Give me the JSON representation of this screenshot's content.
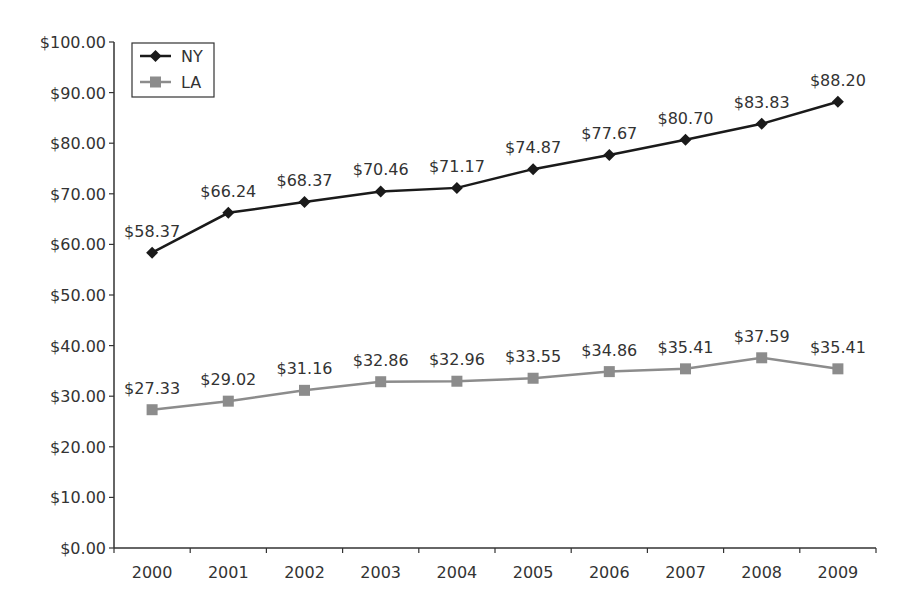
{
  "chart_data": {
    "type": "line",
    "title": "",
    "xlabel": "",
    "ylabel": "",
    "categories": [
      "2000",
      "2001",
      "2002",
      "2003",
      "2004",
      "2005",
      "2006",
      "2007",
      "2008",
      "2009"
    ],
    "series": [
      {
        "name": "NY",
        "color": "#1a1a1a",
        "marker": "diamond",
        "values": [
          58.37,
          66.24,
          68.37,
          70.46,
          71.17,
          74.87,
          77.67,
          80.7,
          83.83,
          88.2
        ],
        "labels": [
          "$58.37",
          "$66.24",
          "$68.37",
          "$70.46",
          "$71.17",
          "$74.87",
          "$77.67",
          "$80.70",
          "$83.83",
          "$88.20"
        ]
      },
      {
        "name": "LA",
        "color": "#8c8c8c",
        "marker": "square",
        "values": [
          27.33,
          29.02,
          31.16,
          32.86,
          32.96,
          33.55,
          34.86,
          35.41,
          37.59,
          35.41
        ],
        "labels": [
          "$27.33",
          "$29.02",
          "$31.16",
          "$32.86",
          "$32.96",
          "$33.55",
          "$34.86",
          "$35.41",
          "$37.59",
          "$35.41"
        ]
      }
    ],
    "ylim": [
      0,
      100
    ],
    "yticks": [
      0,
      10,
      20,
      30,
      40,
      50,
      60,
      70,
      80,
      90,
      100
    ],
    "ytick_labels": [
      "$0.00",
      "$10.00",
      "$20.00",
      "$30.00",
      "$40.00",
      "$50.00",
      "$60.00",
      "$70.00",
      "$80.00",
      "$90.00",
      "$100.00"
    ],
    "grid": false,
    "legend_position": "top-left inside"
  },
  "legend": {
    "items": [
      {
        "label": "NY"
      },
      {
        "label": "LA"
      }
    ]
  }
}
